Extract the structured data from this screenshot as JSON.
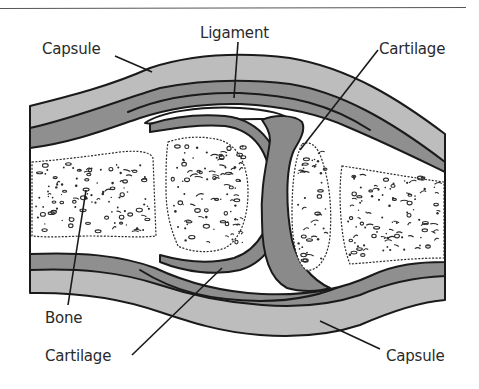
{
  "colors": {
    "background": "#ffffff",
    "capsule": "#bdbdbd",
    "ligament": "#8f8f8f",
    "cartilage": "#8a8a8a",
    "bone_shaft": "#ffffff",
    "outline": "#1a1a1a",
    "label_text": "#2a2a2a"
  },
  "labels": {
    "capsule_top": "Capsule",
    "ligament": "Ligament",
    "cartilage_top": "Cartilage",
    "bone": "Bone",
    "cartilage_bottom": "Cartilage",
    "capsule_bottom": "Capsule"
  }
}
